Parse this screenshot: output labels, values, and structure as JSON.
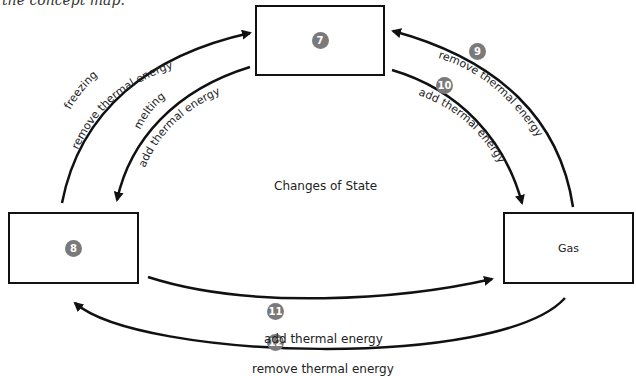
{
  "caption": "the concept map.",
  "center_title": "Changes of State",
  "boxes": {
    "top": {
      "badge": "7",
      "text": ""
    },
    "left": {
      "badge": "8",
      "text": ""
    },
    "right": {
      "badge": "",
      "text": "Gas"
    }
  },
  "arrows": {
    "freezing": {
      "name": "freezing",
      "label": "remove thermal energy"
    },
    "melting": {
      "name": "melting",
      "label": "add thermal energy"
    },
    "a9": {
      "badge": "9",
      "label": "remove thermal energy"
    },
    "a10": {
      "badge": "10",
      "label": "add thermal energy"
    },
    "a11": {
      "badge": "11",
      "label": "add thermal energy"
    },
    "a12": {
      "badge": "12",
      "label": "remove thermal energy"
    }
  },
  "colors": {
    "line": "#111111",
    "badge": "#7a7a7a"
  }
}
